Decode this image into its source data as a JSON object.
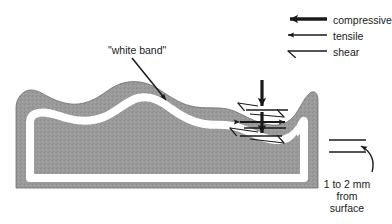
{
  "figure": {
    "name": "white-band-stress-diagram",
    "background_color": "#ffffff",
    "specimen": {
      "fill_color": "#9a9a9a",
      "band_color": "#ffffff",
      "outline_color": "#6e6e6e",
      "band_label": "\"white band\""
    },
    "legend": {
      "items": [
        {
          "key": "compressive",
          "label": "compressive",
          "arrow_style": "thick-solid-arrow",
          "color": "#1a1a1a"
        },
        {
          "key": "tensile",
          "label": "tensile",
          "arrow_style": "thin-solid-arrow",
          "color": "#1a1a1a"
        },
        {
          "key": "shear",
          "label": "shear",
          "arrow_style": "half-barb-arrow",
          "color": "#1a1a1a"
        }
      ]
    },
    "annotations": {
      "depth_note_line1": "1 to 2 mm",
      "depth_note_line2": "from",
      "depth_note_line3": "surface"
    },
    "stress_cluster": {
      "compressive_arrows": 2,
      "tensile_arrows": 2,
      "shear_arrows": 4
    }
  }
}
